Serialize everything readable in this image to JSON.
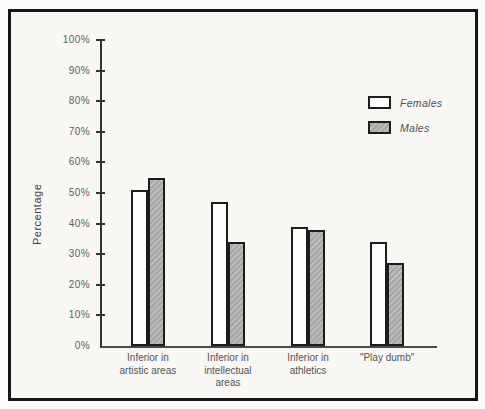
{
  "page": {
    "background_color": "#fbfbfa",
    "frame_border_color": "#161616",
    "paper_color": "#f8f7f4"
  },
  "chart_data": {
    "type": "bar",
    "title": "",
    "xlabel": "",
    "ylabel": "Percentage",
    "categories": [
      "Inferior in artistic areas",
      "Inferior in intellectual areas",
      "Inferior in athletics",
      "\"Play dumb\""
    ],
    "category_label_lines": [
      [
        "Inferior in",
        "artistic areas"
      ],
      [
        "Inferior in",
        "intellectual",
        "areas"
      ],
      [
        "Inferior in",
        "athletics"
      ],
      [
        "\"Play dumb\""
      ]
    ],
    "series": [
      {
        "name": "Females",
        "values": [
          51,
          47,
          39,
          34
        ],
        "fill": "#fdfdfc"
      },
      {
        "name": "Males",
        "values": [
          55,
          34,
          38,
          27
        ],
        "fill": "#a9a9a9",
        "hatch": "diagonal"
      }
    ],
    "ylim": [
      0,
      100
    ],
    "ytick_step": 10,
    "yticks": [
      "0%",
      "10%",
      "20%",
      "30%",
      "40%",
      "50%",
      "60%",
      "70%",
      "80%",
      "90%",
      "100%"
    ],
    "grid": false,
    "legend": {
      "position": "upper-right",
      "entries": [
        "Females",
        "Males"
      ]
    },
    "layout_hints": {
      "group_centers_frac": [
        0.137,
        0.376,
        0.615,
        0.851
      ],
      "bar_width_px": 17
    }
  }
}
